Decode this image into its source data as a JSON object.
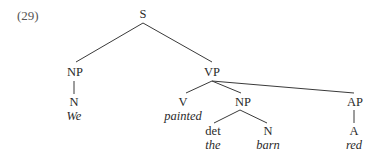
{
  "example_number": "(29)",
  "tree": {
    "S": "S",
    "NP_subject": "NP",
    "N_subject": "N",
    "word_we": "We",
    "VP": "VP",
    "V": "V",
    "word_painted": "painted",
    "NP_object": "NP",
    "det": "det",
    "word_the": "the",
    "N_object": "N",
    "word_barn": "barn",
    "AP": "AP",
    "A": "A",
    "word_red": "red"
  },
  "edges": [
    [
      "S",
      "NP_subject"
    ],
    [
      "S",
      "VP"
    ],
    [
      "NP_subject",
      "N_subject"
    ],
    [
      "VP",
      "V"
    ],
    [
      "VP",
      "NP_object"
    ],
    [
      "VP",
      "AP"
    ],
    [
      "NP_object",
      "det"
    ],
    [
      "NP_object",
      "N_object"
    ],
    [
      "AP",
      "A"
    ]
  ]
}
